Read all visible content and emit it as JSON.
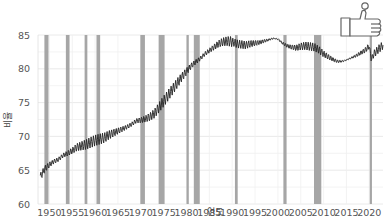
{
  "chart_data": {
    "type": "line",
    "title": "",
    "xlabel": "연도",
    "ylabel": "비율",
    "xlim": [
      1947.5,
      2023
    ],
    "ylim": [
      60,
      85
    ],
    "x_ticks": [
      1950,
      1955,
      1960,
      1965,
      1970,
      1975,
      1980,
      1985,
      1990,
      1995,
      2000,
      2005,
      2010,
      2015,
      2020
    ],
    "y_ticks": [
      60,
      65,
      70,
      75,
      80,
      85
    ],
    "grid": true,
    "legend": null,
    "recession_bands": [
      [
        1948.9,
        1949.8
      ],
      [
        1953.6,
        1954.4
      ],
      [
        1957.7,
        1958.3
      ],
      [
        1960.3,
        1961.1
      ],
      [
        1969.9,
        1970.9
      ],
      [
        1973.9,
        1975.2
      ],
      [
        1980.0,
        1980.5
      ],
      [
        1981.6,
        1982.9
      ],
      [
        1990.6,
        1991.2
      ],
      [
        2001.2,
        2001.9
      ],
      [
        2007.9,
        2009.5
      ],
      [
        2020.1,
        2020.4
      ]
    ],
    "series": [
      {
        "name": "비율",
        "color": "#222222",
        "x": [
          1948,
          1949,
          1950,
          1951,
          1952,
          1953,
          1954,
          1955,
          1956,
          1957,
          1958,
          1959,
          1960,
          1961,
          1962,
          1963,
          1964,
          1965,
          1966,
          1967,
          1968,
          1969,
          1970,
          1971,
          1972,
          1973,
          1974,
          1975,
          1976,
          1977,
          1978,
          1979,
          1980,
          1981,
          1982,
          1983,
          1984,
          1985,
          1986,
          1987,
          1988,
          1989,
          1990,
          1991,
          1992,
          1993,
          1994,
          1995,
          1996,
          1997,
          1998,
          1999,
          2000,
          2001,
          2002,
          2003,
          2004,
          2005,
          2006,
          2007,
          2008,
          2009,
          2010,
          2011,
          2012,
          2013,
          2014,
          2015,
          2016,
          2017,
          2018,
          2019,
          2020,
          2020.4,
          2021,
          2022,
          2023
        ],
        "values": [
          64.0,
          65.2,
          65.8,
          66.3,
          66.6,
          67.2,
          67.5,
          67.9,
          68.4,
          68.6,
          68.8,
          69.1,
          69.4,
          69.6,
          69.8,
          70.2,
          70.5,
          70.8,
          71.1,
          71.4,
          71.8,
          72.3,
          72.4,
          72.6,
          72.9,
          73.4,
          74.3,
          75.2,
          76.1,
          77.0,
          77.9,
          78.8,
          79.6,
          80.4,
          81.0,
          81.5,
          82.2,
          82.7,
          83.2,
          83.7,
          84.0,
          84.1,
          84.0,
          83.7,
          83.6,
          83.5,
          83.7,
          83.8,
          83.9,
          84.1,
          84.3,
          84.5,
          84.4,
          83.8,
          83.4,
          83.2,
          83.1,
          83.3,
          83.4,
          83.3,
          83.2,
          82.8,
          82.2,
          81.8,
          81.4,
          81.1,
          81.1,
          81.3,
          81.6,
          81.9,
          82.3,
          82.7,
          83.4,
          81.4,
          82.2,
          82.9,
          83.5
        ]
      }
    ]
  },
  "decorations": {
    "corner_icon": "thumbs-up-icon"
  }
}
